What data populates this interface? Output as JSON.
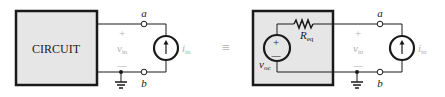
{
  "left_circuit": {
    "box_label": "CIRCUIT",
    "terminal_top": "a",
    "terminal_bottom": "b",
    "voltage_plus": "+",
    "voltage_minus": "—",
    "voltage_label": "v",
    "voltage_sub": "in",
    "current_label": "i",
    "current_sub": "in"
  },
  "equivalence_symbol": "≡",
  "right_circuit": {
    "resistor_label": "R",
    "resistor_sub": "eq",
    "source_label": "v",
    "source_sub": "oc",
    "source_plus": "+",
    "source_minus": "—",
    "terminal_top": "a",
    "terminal_bottom": "b",
    "voltage_plus": "+",
    "voltage_minus": "—",
    "voltage_label": "v",
    "voltage_sub": "in",
    "current_label": "i",
    "current_sub": "in"
  },
  "colors": {
    "box_fill": "#e6e6e6",
    "line": "#1a1a1a",
    "faded_text": "#b0b0b0"
  }
}
